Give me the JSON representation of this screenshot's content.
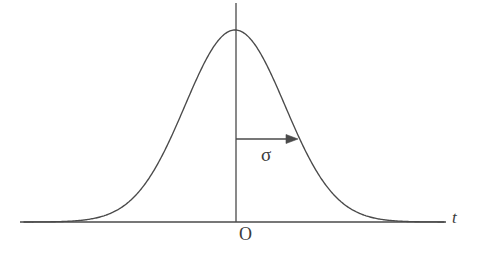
{
  "figure": {
    "kind": "normal-distribution-curve-diagram",
    "background_color": "#ffffff",
    "stroke_color": "#4a4a4a",
    "text_color": "#3b3b3b",
    "labels": {
      "origin": "O",
      "x_axis": "t",
      "sigma": "σ"
    }
  },
  "chart_data": {
    "type": "line",
    "title": "",
    "xlabel": "t",
    "ylabel": "",
    "grid": false,
    "legend": null,
    "curve_name": "gaussian-density",
    "annotations": [
      {
        "name": "sigma-arrow",
        "label": "σ",
        "kind": "horizontal-arrow",
        "from_x": 0,
        "to_x": 1,
        "at_y_fraction_of_peak": 0.43,
        "description": "arrow from the vertical axis rightward to the curve, labelled sigma"
      },
      {
        "name": "origin-mark",
        "label": "O",
        "kind": "point-label",
        "x": 0,
        "y": 0
      },
      {
        "name": "t-axis-name",
        "label": "t",
        "kind": "axis-name",
        "position": "right-end-of-x-axis"
      }
    ],
    "axes": {
      "x": {
        "pixel_start": 20,
        "pixel_end": 446,
        "pixel_y": 222,
        "origin_pixel_x": 236,
        "has_arrowhead": false
      },
      "y": {
        "pixel_x": 236,
        "pixel_top": 3,
        "pixel_bottom": 222,
        "has_arrowhead": false
      }
    },
    "gaussian": {
      "peak_pixel_x": 235,
      "peak_pixel_y": 30,
      "baseline_pixel_y": 222,
      "sigma_pixels": 50,
      "x_pixel_min": 24,
      "x_pixel_max": 444
    },
    "x": [
      24,
      34,
      44,
      54,
      64,
      74,
      84,
      94,
      104,
      114,
      124,
      134,
      144,
      154,
      164,
      174,
      184,
      194,
      204,
      214,
      224,
      235,
      245,
      255,
      265,
      275,
      285,
      295,
      305,
      315,
      325,
      335,
      345,
      355,
      365,
      375,
      385,
      395,
      405,
      415,
      425,
      435,
      444
    ],
    "y": [
      221.9,
      221.8,
      221.6,
      221.2,
      220.6,
      219.6,
      218.1,
      215.8,
      212.4,
      207.7,
      201.3,
      193.1,
      182.9,
      170.9,
      157.2,
      142.3,
      126.8,
      111.4,
      97.1,
      84.9,
      75.4,
      69.3,
      67.8,
      70.8,
      78.0,
      89.1,
      103.4,
      119.9,
      137.4,
      154.9,
      171.2,
      185.5,
      197.2,
      206.2,
      212.5,
      216.7,
      219.3,
      220.8,
      221.6,
      222.0,
      222.1,
      222.1,
      222.1
    ]
  }
}
